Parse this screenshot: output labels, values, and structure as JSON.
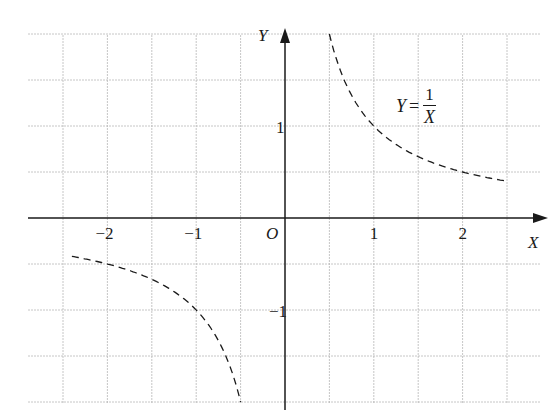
{
  "chart_data": {
    "type": "line",
    "title": "",
    "function_label": {
      "lhs": "Y",
      "equals": "=",
      "numerator": "1",
      "denominator": "X"
    },
    "xlabel": "X",
    "ylabel": "Y",
    "origin_label": "O",
    "x_ticks": [
      {
        "value": -2,
        "label": "−2"
      },
      {
        "value": -1,
        "label": "−1"
      },
      {
        "value": 1,
        "label": "1"
      },
      {
        "value": 2,
        "label": "2"
      }
    ],
    "y_ticks": [
      {
        "value": 1,
        "label": "1"
      },
      {
        "value": -1,
        "label": "−1"
      }
    ],
    "xlim": [
      -2.9,
      2.9
    ],
    "ylim": [
      -2.0,
      2.0
    ],
    "grid": true,
    "grid_step": 0.5,
    "line_style": "dashed",
    "series": [
      {
        "name": "branch_positive",
        "x": [
          0.5,
          0.75,
          1.0,
          1.25,
          1.5,
          2.0,
          2.5
        ],
        "y": [
          2.0,
          1.333,
          1.0,
          0.8,
          0.667,
          0.5,
          0.4
        ]
      },
      {
        "name": "branch_negative",
        "x": [
          -2.4,
          -2.0,
          -1.5,
          -1.0,
          -0.75,
          -0.5
        ],
        "y": [
          -0.417,
          -0.5,
          -0.667,
          -1.0,
          -1.333,
          -2.0
        ]
      }
    ]
  },
  "colors": {
    "grid": "#b8b8b8",
    "axis": "#1a1a1a",
    "curve": "#1a1a1a",
    "background": "#ffffff"
  }
}
